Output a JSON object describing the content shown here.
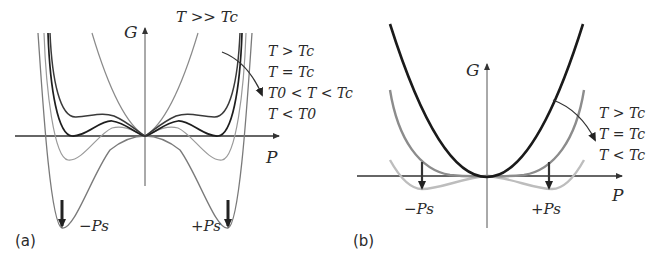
{
  "panels": [
    {
      "id": "a",
      "tag": "(a)",
      "y_axis_label": "G",
      "x_axis_label": "P",
      "top_label": "T >> Tc",
      "min_labels": {
        "left": "−Ps",
        "right": "+Ps"
      },
      "legend": [
        "T > Tc",
        "T = Tc",
        "T0 < T < Tc",
        "T < T0"
      ],
      "curves": [
        {
          "name": "T >> Tc",
          "shape": "single-well parabola",
          "color": "#8a8a8a"
        },
        {
          "name": "T > Tc",
          "shape": "central min + shoulders above zero",
          "color": "#3a3a3a"
        },
        {
          "name": "T = Tc",
          "shape": "three equal minima at zero",
          "color": "#1e1e1e"
        },
        {
          "name": "T0 < T < Tc",
          "shape": "side minima below zero, central metastable",
          "color": "#9a9a9a"
        },
        {
          "name": "T < T0",
          "shape": "deep double well at ±Ps",
          "color": "#7a7a7a"
        }
      ]
    },
    {
      "id": "b",
      "tag": "(b)",
      "y_axis_label": "G",
      "x_axis_label": "P",
      "min_labels": {
        "left": "−Ps",
        "right": "+Ps"
      },
      "legend": [
        "T > Tc",
        "T = Tc",
        "T < Tc"
      ],
      "curves": [
        {
          "name": "T > Tc",
          "shape": "parabola",
          "color": "#1a1a1a"
        },
        {
          "name": "T = Tc",
          "shape": "flat quartic",
          "color": "#8c8c8c"
        },
        {
          "name": "T < Tc",
          "shape": "shallow double well",
          "color": "#bdbdbd"
        }
      ]
    }
  ]
}
